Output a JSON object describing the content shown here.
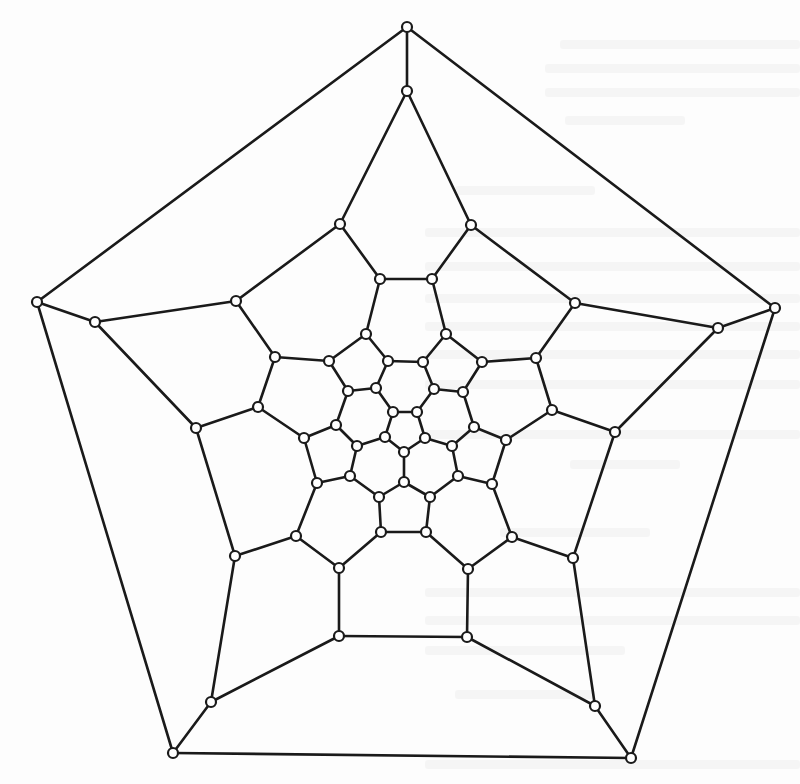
{
  "figure": {
    "type": "schlegel-diagram",
    "vertex_count": 60,
    "edge_count": 90,
    "colors": {
      "edge": "#1a1a1a",
      "vertex_fill": "#ffffff",
      "vertex_stroke": "#1a1a1a",
      "background": "#fdfdfd"
    },
    "vertex_radius": 5,
    "vertices": [
      [
        407,
        27
      ],
      [
        775,
        308
      ],
      [
        631,
        758
      ],
      [
        173,
        753
      ],
      [
        37,
        302
      ],
      [
        407,
        91
      ],
      [
        718,
        328
      ],
      [
        595,
        706
      ],
      [
        211,
        702
      ],
      [
        95,
        322
      ],
      [
        340,
        224
      ],
      [
        471,
        225
      ],
      [
        575,
        303
      ],
      [
        615,
        432
      ],
      [
        573,
        558
      ],
      [
        467,
        637
      ],
      [
        339,
        636
      ],
      [
        235,
        556
      ],
      [
        196,
        428
      ],
      [
        236,
        301
      ],
      [
        380,
        279
      ],
      [
        432,
        279
      ],
      [
        536,
        358
      ],
      [
        552,
        410
      ],
      [
        512,
        537
      ],
      [
        468,
        569
      ],
      [
        339,
        568
      ],
      [
        296,
        536
      ],
      [
        258,
        407
      ],
      [
        275,
        357
      ],
      [
        366,
        334
      ],
      [
        446,
        334
      ],
      [
        482,
        362
      ],
      [
        506,
        440
      ],
      [
        492,
        484
      ],
      [
        426,
        532
      ],
      [
        381,
        532
      ],
      [
        317,
        483
      ],
      [
        304,
        438
      ],
      [
        329,
        361
      ],
      [
        388,
        361
      ],
      [
        423,
        362
      ],
      [
        463,
        392
      ],
      [
        474,
        427
      ],
      [
        458,
        476
      ],
      [
        430,
        497
      ],
      [
        379,
        497
      ],
      [
        350,
        476
      ],
      [
        336,
        425
      ],
      [
        348,
        391
      ],
      [
        376,
        388
      ],
      [
        434,
        389
      ],
      [
        452,
        446
      ],
      [
        404,
        482
      ],
      [
        357,
        446
      ],
      [
        393,
        412
      ],
      [
        417,
        412
      ],
      [
        425,
        438
      ],
      [
        404,
        452
      ],
      [
        385,
        437
      ]
    ],
    "edges": [
      [
        1,
        2
      ],
      [
        2,
        3
      ],
      [
        3,
        4
      ],
      [
        4,
        5
      ],
      [
        5,
        1
      ],
      [
        1,
        6
      ],
      [
        2,
        7
      ],
      [
        3,
        8
      ],
      [
        4,
        9
      ],
      [
        5,
        10
      ],
      [
        6,
        11
      ],
      [
        6,
        12
      ],
      [
        7,
        13
      ],
      [
        7,
        14
      ],
      [
        8,
        15
      ],
      [
        8,
        16
      ],
      [
        9,
        17
      ],
      [
        9,
        18
      ],
      [
        10,
        19
      ],
      [
        10,
        20
      ],
      [
        11,
        21
      ],
      [
        11,
        20
      ],
      [
        12,
        22
      ],
      [
        12,
        13
      ],
      [
        13,
        23
      ],
      [
        14,
        24
      ],
      [
        14,
        15
      ],
      [
        15,
        25
      ],
      [
        16,
        26
      ],
      [
        16,
        17
      ],
      [
        17,
        27
      ],
      [
        18,
        28
      ],
      [
        18,
        19
      ],
      [
        19,
        29
      ],
      [
        20,
        30
      ],
      [
        21,
        22
      ],
      [
        21,
        31
      ],
      [
        22,
        32
      ],
      [
        23,
        33
      ],
      [
        23,
        24
      ],
      [
        24,
        34
      ],
      [
        25,
        35
      ],
      [
        25,
        26
      ],
      [
        26,
        36
      ],
      [
        27,
        37
      ],
      [
        27,
        28
      ],
      [
        28,
        38
      ],
      [
        29,
        39
      ],
      [
        29,
        30
      ],
      [
        30,
        40
      ],
      [
        31,
        40
      ],
      [
        31,
        41
      ],
      [
        32,
        42
      ],
      [
        32,
        33
      ],
      [
        33,
        43
      ],
      [
        34,
        44
      ],
      [
        34,
        35
      ],
      [
        35,
        45
      ],
      [
        36,
        46
      ],
      [
        36,
        37
      ],
      [
        37,
        47
      ],
      [
        38,
        48
      ],
      [
        38,
        39
      ],
      [
        39,
        49
      ],
      [
        40,
        50
      ],
      [
        41,
        51
      ],
      [
        41,
        42
      ],
      [
        42,
        52
      ],
      [
        43,
        52
      ],
      [
        43,
        44
      ],
      [
        44,
        53
      ],
      [
        45,
        53
      ],
      [
        45,
        46
      ],
      [
        46,
        54
      ],
      [
        47,
        54
      ],
      [
        47,
        48
      ],
      [
        48,
        55
      ],
      [
        49,
        55
      ],
      [
        49,
        50
      ],
      [
        50,
        51
      ],
      [
        51,
        56
      ],
      [
        52,
        57
      ],
      [
        53,
        58
      ],
      [
        54,
        59
      ],
      [
        55,
        60
      ],
      [
        56,
        57
      ],
      [
        57,
        58
      ],
      [
        58,
        59
      ],
      [
        59,
        60
      ],
      [
        60,
        56
      ]
    ]
  },
  "page": {
    "bleed_through_text": "illegible mirrored text from reverse side of scanned page"
  }
}
